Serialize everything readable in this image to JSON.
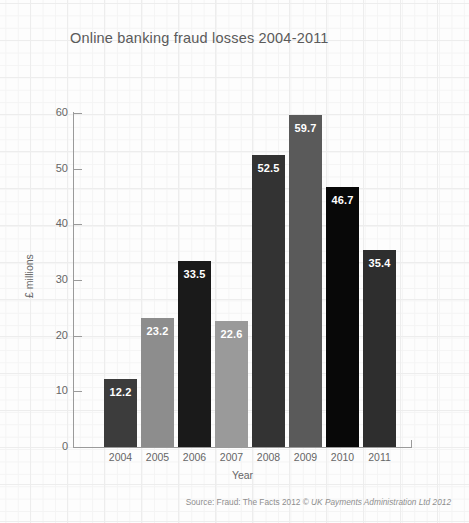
{
  "chart_data": {
    "type": "bar",
    "title": "Online banking fraud losses 2004-2011",
    "xlabel": "Year",
    "ylabel": "£ millions",
    "categories": [
      "2004",
      "2005",
      "2006",
      "2007",
      "2008",
      "2009",
      "2010",
      "2011"
    ],
    "values": [
      12.2,
      23.2,
      33.5,
      22.6,
      52.5,
      59.7,
      46.7,
      35.4
    ],
    "value_labels": [
      "12.2",
      "23.2",
      "33.5",
      "22.6",
      "52.5",
      "59.7",
      "46.7",
      "35.4"
    ],
    "bar_colors": [
      "#3c3c3c",
      "#8d8d8d",
      "#1a1a1a",
      "#9a9a9a",
      "#333333",
      "#5a5a5a",
      "#080808",
      "#2e2e2e"
    ],
    "ylim": [
      0,
      60
    ],
    "yticks": [
      0,
      10,
      20,
      30,
      40,
      50,
      60
    ],
    "ytick_labels": [
      "0",
      "10",
      "20",
      "30",
      "40",
      "50",
      "60"
    ],
    "grid": "background graph-paper grid, no plot gridlines",
    "legend": "none",
    "data_label_position": "inside top of bar, white bold"
  },
  "source": {
    "prefix": "Source: Fraud: The Facts 2012 © ",
    "italic": "UK Payments Administration Ltd 2012"
  }
}
